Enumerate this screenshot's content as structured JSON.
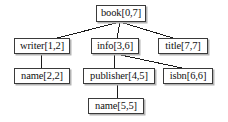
{
  "diagram": {
    "type": "tree",
    "background_color": "#ffffff",
    "node_border_color": "#3a3a3a",
    "node_fill_color": "#ffffff",
    "node_shadow_color": "#b4b4b4",
    "edge_color": "#1a1a1a",
    "nodes": [
      {
        "id": "book",
        "label": "book[0,7]",
        "name": "book",
        "interval": "[0,7]",
        "x": 96,
        "y": 5,
        "w": 50,
        "h": 17,
        "font_size": 10.5
      },
      {
        "id": "writer",
        "label": "writer[1,2]",
        "name": "writer",
        "interval": "[1,2]",
        "x": 14,
        "y": 38,
        "w": 56,
        "h": 16,
        "font_size": 10.5
      },
      {
        "id": "info",
        "label": "info[3,6]",
        "name": "info",
        "interval": "[3,6]",
        "x": 91,
        "y": 38,
        "w": 48,
        "h": 16,
        "font_size": 10.5
      },
      {
        "id": "title",
        "label": "title[7,7]",
        "name": "title",
        "interval": "[7,7]",
        "x": 158,
        "y": 38,
        "w": 50,
        "h": 16,
        "font_size": 10.5
      },
      {
        "id": "name2",
        "label": "name[2,2]",
        "name": "name",
        "interval": "[2,2]",
        "x": 14,
        "y": 68,
        "w": 56,
        "h": 16,
        "font_size": 10.5
      },
      {
        "id": "publisher",
        "label": "publisher[4,5]",
        "name": "publisher",
        "interval": "[4,5]",
        "x": 83,
        "y": 68,
        "w": 72,
        "h": 16,
        "font_size": 10.5
      },
      {
        "id": "isbn",
        "label": "isbn[6,6]",
        "name": "isbn",
        "interval": "[6,6]",
        "x": 163,
        "y": 68,
        "w": 50,
        "h": 16,
        "font_size": 10.5
      },
      {
        "id": "name5",
        "label": "name[5,5]",
        "name": "name",
        "interval": "[5,5]",
        "x": 88,
        "y": 98,
        "w": 56,
        "h": 16,
        "font_size": 10.5
      }
    ],
    "edges": [
      {
        "id": "book-writer",
        "from": "book",
        "to": "writer",
        "x1": 120,
        "y1": 22,
        "x2": 57,
        "y2": 38
      },
      {
        "id": "book-info",
        "from": "book",
        "to": "info",
        "x1": 120,
        "y1": 22,
        "x2": 117,
        "y2": 38
      },
      {
        "id": "book-title",
        "from": "book",
        "to": "title",
        "x1": 120,
        "y1": 22,
        "x2": 173,
        "y2": 38
      },
      {
        "id": "writer-name2",
        "from": "writer",
        "to": "name2",
        "x1": 41,
        "y1": 54,
        "x2": 41,
        "y2": 68
      },
      {
        "id": "info-publisher",
        "from": "info",
        "to": "publisher",
        "x1": 115,
        "y1": 54,
        "x2": 114,
        "y2": 68
      },
      {
        "id": "info-isbn",
        "from": "info",
        "to": "isbn",
        "x1": 116,
        "y1": 54,
        "x2": 182,
        "y2": 68
      },
      {
        "id": "publisher-name5",
        "from": "publisher",
        "to": "name5",
        "x1": 117,
        "y1": 84,
        "x2": 117,
        "y2": 98
      }
    ]
  }
}
